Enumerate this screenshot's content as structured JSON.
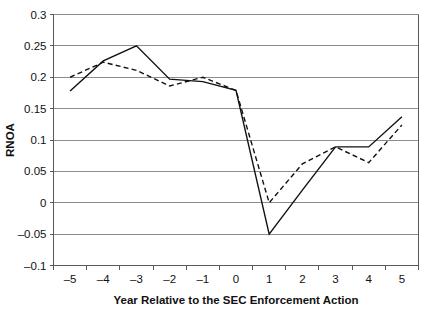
{
  "chart_data": {
    "type": "line",
    "title": "",
    "xlabel": "Year Relative to the SEC Enforcement Action",
    "ylabel": "RNOA",
    "x": [
      -5,
      -4,
      -3,
      -2,
      -1,
      0,
      1,
      2,
      3,
      4,
      5
    ],
    "xtick_labels": [
      "–5",
      "–4",
      "–3",
      "–2",
      "–1",
      "0",
      "1",
      "2",
      "3",
      "4",
      "5"
    ],
    "ytick_labels": [
      "0.3",
      "0.25",
      "0.2",
      "0.15",
      "0.1",
      "0.05",
      "0",
      "–0.05",
      "–0.1"
    ],
    "ytick_values": [
      0.3,
      0.25,
      0.2,
      0.15,
      0.1,
      0.05,
      0,
      -0.05,
      -0.1
    ],
    "xlim": [
      -5.5,
      5.5
    ],
    "ylim": [
      -0.1,
      0.3
    ],
    "grid": true,
    "legend": "none",
    "series": [
      {
        "name": "solid-series",
        "style": "solid",
        "color": "#111111",
        "values": [
          0.178,
          0.226,
          0.25,
          0.197,
          0.193,
          0.179,
          -0.05,
          0.02,
          0.089,
          0.089,
          0.137
        ]
      },
      {
        "name": "dashed-series",
        "style": "dashed",
        "color": "#111111",
        "values": [
          0.2,
          0.224,
          0.211,
          0.186,
          0.2,
          0.179,
          0.0,
          0.062,
          0.089,
          0.064,
          0.124
        ]
      }
    ]
  }
}
